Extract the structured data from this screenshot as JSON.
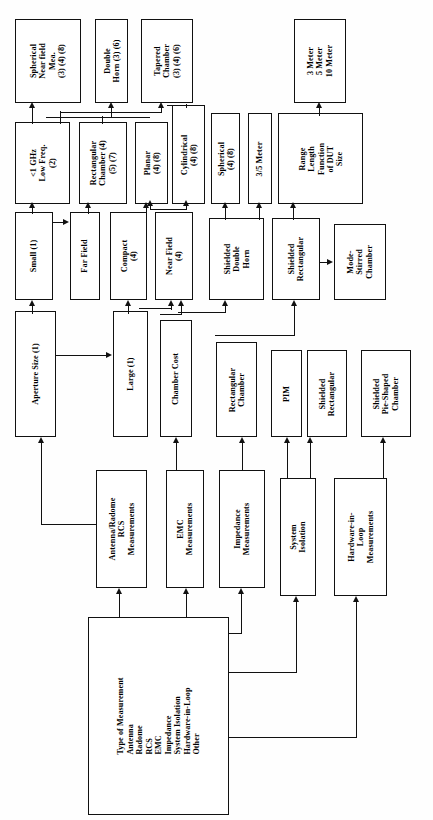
{
  "diagram": {
    "orientation": "rotated-90-ccw",
    "nodes": {
      "type_of_measurement": "Type of Measurement\nAntenna\nRadome\nRCS\nEMC\nImpedance\nSystem Isolation\nHardware-in-Loop\nOther",
      "antenna_radome_rcs": "Antenna/Radome\nRCS\nMeasurements",
      "emc_measurements": "EMC\nMeasurements",
      "impedance_measurements": "Impedance\nMeasurements",
      "system_isolation": "System\nIsolation",
      "hardware_in_loop": "Hardware-in-\nLoop\nMeasurements",
      "aperture_size": "Aperture Size (1)",
      "large": "Large (1)",
      "chamber_cost": "Chamber Cost",
      "rectangular_chamber_b": "Rectangular\nChamber",
      "pim": "PIM",
      "shielded_rectangular_b": "Shielded\nRectangular",
      "shielded_pie_shaped": "Shielded\nPie-Shaped\nChamber",
      "small": "Small (1)",
      "far_field": "Far Field",
      "compact": "Compact\n(4)",
      "near_field": "Near Field\n(4)",
      "shielded_double_horn": "Shielded\nDouble\nHorn",
      "shielded_rectangular_a": "Shielded\nRectangular",
      "mode_stirred_chamber": "Mode-\nStirred\nChamber",
      "low_freq": "<1 GHz\nLow Freq.\n(2)",
      "rectangular_chamber_a": "Rectangular\nChamber (4)\n(5) (7)",
      "planar": "Planar\n(4) (8)",
      "cylindrical": "Cylindrical\n(4) (8)",
      "spherical": "Spherical\n(4) (8)",
      "three_five_meter": "3/5 Meter",
      "range_length": "Range\nLength\nFunction\nof DUT\nSize",
      "spherical_near_field_mea": "Spherical\nNear field\nMea.\n(3) (4) (8)",
      "double_horn": "Double\nHorn (3) (6)",
      "tapered_chamber": "Tapered\nChamber\n(3) (4) (6)",
      "meters": "3 Meter\n5 Meter\n10 Meter"
    },
    "edges": [
      "type_of_measurement -> antenna_radome_rcs",
      "type_of_measurement -> emc_measurements",
      "type_of_measurement -> impedance_measurements",
      "type_of_measurement -> system_isolation",
      "type_of_measurement -> hardware_in_loop",
      "antenna_radome_rcs -> aperture_size",
      "emc_measurements -> chamber_cost",
      "impedance_measurements -> rectangular_chamber_b",
      "system_isolation -> pim",
      "system_isolation -> shielded_rectangular_b",
      "hardware_in_loop -> shielded_pie_shaped",
      "aperture_size -> small",
      "aperture_size -> large",
      "large -> compact",
      "large -> near_field",
      "chamber_cost -> near_field",
      "chamber_cost -> shielded_double_horn",
      "rectangular_chamber_b -> shielded_rectangular_a",
      "small -> low_freq",
      "small -> far_field",
      "far_field -> rectangular_chamber_a",
      "compact -> planar",
      "near_field -> planar",
      "near_field -> cylindrical",
      "shielded_double_horn -> spherical",
      "shielded_rectangular_a -> three_five_meter",
      "shielded_rectangular_a -> range_length",
      "shielded_rectangular_a -> mode_stirred_chamber",
      "low_freq -> spherical_near_field_mea",
      "low_freq -> double_horn",
      "low_freq -> tapered_chamber",
      "rectangular_chamber_a -> tapered_chamber",
      "cylindrical -> tapered_chamber",
      "range_length -> meters"
    ]
  }
}
